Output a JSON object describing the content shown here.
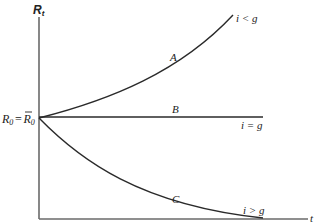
{
  "diagram": {
    "y_axis_label": "R",
    "y_axis_label_sub": "t",
    "x_axis_label": "t",
    "origin_label": {
      "left": "R",
      "left_sub": "0",
      "equals": "=",
      "right": "R",
      "right_sub": "0",
      "right_has_bar": true
    },
    "curves": [
      {
        "id": "A",
        "label": "A",
        "condition": "i < g",
        "shape": "rising convex"
      },
      {
        "id": "B",
        "label": "B",
        "condition": "i = g",
        "shape": "horizontal"
      },
      {
        "id": "C",
        "label": "C",
        "condition": "i > g",
        "shape": "falling convex"
      }
    ],
    "colors": {
      "axis": "#6a6a6a",
      "curve": "#2a2a2a",
      "text": "#222222",
      "background": "#ffffff"
    }
  }
}
